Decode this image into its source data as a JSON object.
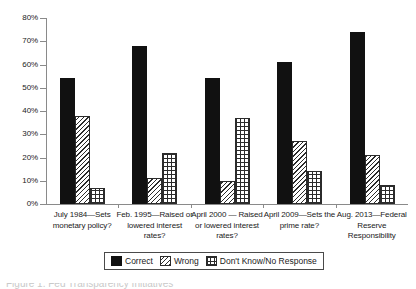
{
  "chart_data": {
    "type": "bar",
    "title": "",
    "xlabel": "",
    "ylabel": "",
    "ylim": [
      0,
      80
    ],
    "ytick_labels": [
      "0%",
      "10%",
      "20%",
      "30%",
      "40%",
      "50%",
      "60%",
      "70%",
      "80%"
    ],
    "ytick_values": [
      0,
      10,
      20,
      30,
      40,
      50,
      60,
      70,
      80
    ],
    "grid": false,
    "legend_position": "bottom-center",
    "categories": [
      "July 1984—Sets monetary policy?",
      "Feb. 1995—Raised or lowered interest rates?",
      "April 2000 — Raised or lowered interest rates?",
      "April 2009—Sets the prime rate?",
      "Aug. 2013—Federal Reserve Responsibility"
    ],
    "series": [
      {
        "name": "Correct",
        "values": [
          54,
          68,
          54,
          61,
          74
        ]
      },
      {
        "name": "Wrong",
        "values": [
          38,
          11,
          10,
          27,
          21
        ]
      },
      {
        "name": "Don't Know/No Response",
        "values": [
          7,
          22,
          37,
          14,
          8
        ]
      }
    ]
  },
  "legend": {
    "items": [
      {
        "label": "Correct",
        "pattern": "solid-black"
      },
      {
        "label": "Wrong",
        "pattern": "diagonal-hatch"
      },
      {
        "label": "Don't Know/No Response",
        "pattern": "cross-grid"
      }
    ]
  },
  "colors": {
    "correct": "#111111",
    "hatch": "#2b2b2b",
    "axis": "#8a8a8a",
    "background": "#ffffff"
  },
  "footer": {
    "cropped_caption": "Figure 1. Fed Transparency Initiatives"
  }
}
